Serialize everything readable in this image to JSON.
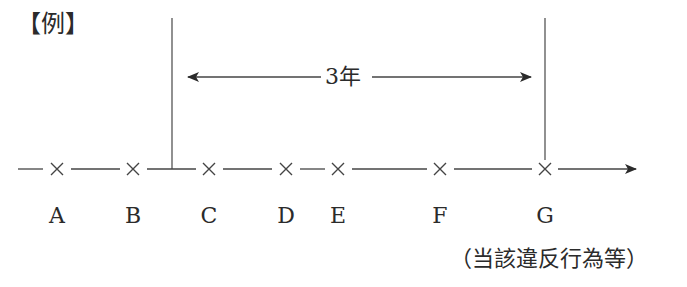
{
  "title": "【例】",
  "period_label": "3年",
  "note": "（当該違反行為等）",
  "colors": {
    "line": "#2b2b2b",
    "background": "#ffffff"
  },
  "timeline": {
    "points": [
      {
        "label": "A",
        "x": 57
      },
      {
        "label": "B",
        "x": 133
      },
      {
        "label": "C",
        "x": 209
      },
      {
        "label": "D",
        "x": 286
      },
      {
        "label": "E",
        "x": 338
      },
      {
        "label": "F",
        "x": 440
      },
      {
        "label": "G",
        "x": 545
      }
    ],
    "period_start_x": 172,
    "period_end_x": 545,
    "axis_y": 169
  }
}
